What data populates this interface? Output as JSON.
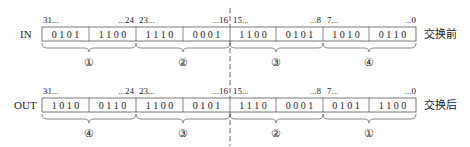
{
  "diagram": {
    "rows": [
      {
        "label": "IN",
        "caption": "交换前",
        "bit_labels": [
          "31...",
          "...24",
          "23...",
          "...16",
          "15...",
          "...8",
          "7...",
          "...0"
        ],
        "nibbles": [
          "0 1 0 1",
          "1 1 0 0",
          "1 1 1 0",
          "0 0 0 1",
          "1 1 0 0",
          "0 1 0 1",
          "1 0 1 0",
          "0 1 1 0"
        ],
        "byte_markers": [
          "①",
          "②",
          "③",
          "④"
        ]
      },
      {
        "label": "OUT",
        "caption": "交换后",
        "bit_labels": [
          "31...",
          "...24",
          "23...",
          "...16",
          "15...",
          "...8",
          "7...",
          "...0"
        ],
        "nibbles": [
          "1 0 1 0",
          "0 1 1 0",
          "1 1 0 0",
          "0 1 0 1",
          "1 1 1 0",
          "0 0 0 1",
          "0 1 0 1",
          "1 1 0 0"
        ],
        "byte_markers": [
          "④",
          "③",
          "②",
          "①"
        ]
      }
    ]
  }
}
